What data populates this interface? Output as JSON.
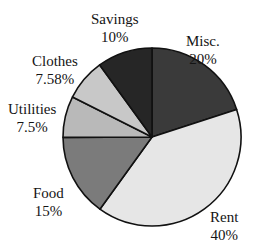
{
  "chart_data": {
    "type": "pie",
    "title": "",
    "start_angle_deg": 0,
    "direction": "clockwise",
    "center": [
      152,
      137
    ],
    "radius": 89,
    "slices": [
      {
        "label": "Misc.",
        "pct_label": "20%",
        "value": 20,
        "color": "#3a3a3a"
      },
      {
        "label": "Rent",
        "pct_label": "40%",
        "value": 40,
        "color": "#e6e6e6"
      },
      {
        "label": "Food",
        "pct_label": "15%",
        "value": 15,
        "color": "#7b7b7b"
      },
      {
        "label": "Utilities",
        "pct_label": "7.5%",
        "value": 7.5,
        "color": "#b9b9b9"
      },
      {
        "label": "Clothes",
        "pct_label": "7.58%",
        "value": 7.58,
        "color": "#c8c8c8"
      },
      {
        "label": "Savings",
        "pct_label": "10%",
        "value": 10,
        "color": "#262626"
      }
    ],
    "legend": "none",
    "labels_position": "outside"
  },
  "labels": [
    {
      "name": "Misc.",
      "pct": "20%",
      "x": 186,
      "y": 33
    },
    {
      "name": "Rent",
      "pct": "40%",
      "x": 210,
      "y": 209
    },
    {
      "name": "Food",
      "pct": "15%",
      "x": 30,
      "y": 183
    },
    {
      "name": "Utilities",
      "pct": "7.5%",
      "x": 6,
      "y": 100
    },
    {
      "name": "Clothes",
      "pct": "7.58%",
      "x": 32,
      "y": 53
    },
    {
      "name": "Savings",
      "pct": "10%",
      "x": 88,
      "y": 9
    }
  ]
}
